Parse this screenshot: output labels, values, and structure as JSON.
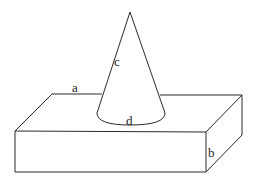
{
  "diagram": {
    "title": "",
    "shapes": [
      {
        "id": "cone",
        "type": "cone",
        "description": "Cone standing on top face of a rectangular box"
      },
      {
        "id": "box",
        "type": "rectangular-prism",
        "description": "Rectangular box (cuboid)"
      }
    ],
    "labels": {
      "a": "a",
      "b": "b",
      "c": "c",
      "d": "d"
    },
    "label_meanings": {
      "a": "length edge of box top (back edge)",
      "b": "height edge of box (right front vertical)",
      "c": "slant side of cone",
      "d": "base circle of cone"
    },
    "colors": {
      "stroke": "#2a2a2a",
      "background": "#ffffff"
    }
  }
}
